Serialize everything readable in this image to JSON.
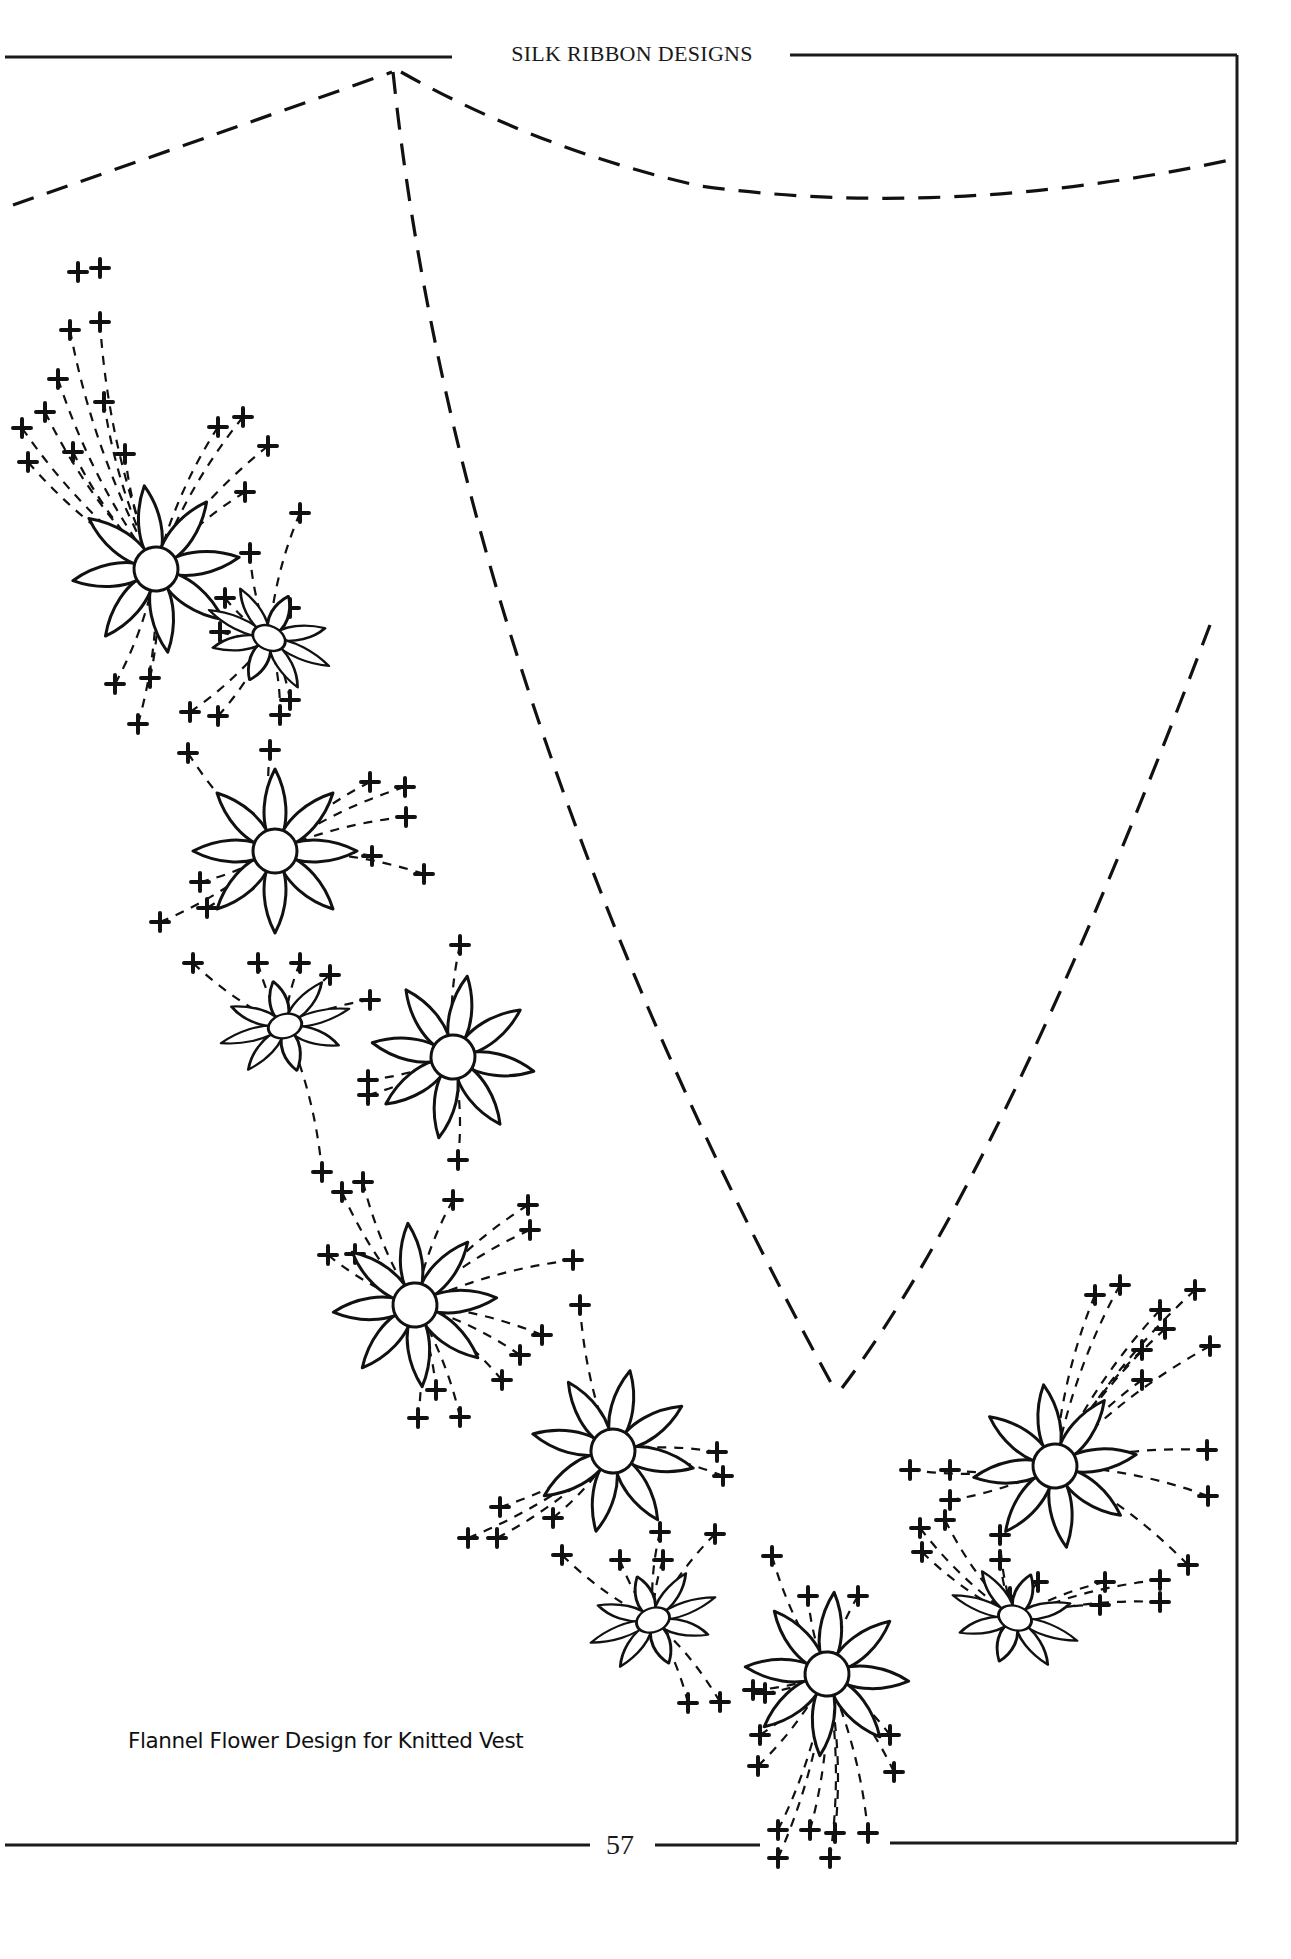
{
  "header": {
    "running_title": "SILK RIBBON DESIGNS"
  },
  "figure": {
    "caption": "Flannel Flower Design for Knitted Vest",
    "stroke_color": "#111111",
    "flowers": [
      {
        "x": 156,
        "y": 569,
        "r": 22,
        "petal": 84,
        "rot": -8,
        "tilt": 1.0
      },
      {
        "x": 269,
        "y": 638,
        "r": 17,
        "petal": 66,
        "rot": 25,
        "tilt": 0.7
      },
      {
        "x": 275,
        "y": 851,
        "r": 22,
        "petal": 82,
        "rot": 0,
        "tilt": 1.0
      },
      {
        "x": 285,
        "y": 1026,
        "r": 17,
        "petal": 66,
        "rot": -15,
        "tilt": 0.7
      },
      {
        "x": 453,
        "y": 1057,
        "r": 22,
        "petal": 82,
        "rot": 10,
        "tilt": 1.0
      },
      {
        "x": 415,
        "y": 1305,
        "r": 22,
        "petal": 82,
        "rot": -5,
        "tilt": 1.0
      },
      {
        "x": 613,
        "y": 1451,
        "r": 22,
        "petal": 82,
        "rot": 12,
        "tilt": 1.0
      },
      {
        "x": 653,
        "y": 1620,
        "r": 17,
        "petal": 66,
        "rot": -20,
        "tilt": 0.7
      },
      {
        "x": 827,
        "y": 1674,
        "r": 22,
        "petal": 82,
        "rot": 5,
        "tilt": 1.0
      },
      {
        "x": 1015,
        "y": 1618,
        "r": 17,
        "petal": 66,
        "rot": 20,
        "tilt": 0.7
      },
      {
        "x": 1055,
        "y": 1466,
        "r": 22,
        "petal": 82,
        "rot": -8,
        "tilt": 1.0
      }
    ],
    "crosses": [
      [
        78,
        272
      ],
      [
        100,
        268
      ],
      [
        70,
        330
      ],
      [
        100,
        322
      ],
      [
        58,
        379
      ],
      [
        104,
        402
      ],
      [
        45,
        412
      ],
      [
        22,
        428
      ],
      [
        28,
        462
      ],
      [
        73,
        452
      ],
      [
        125,
        454
      ],
      [
        218,
        427
      ],
      [
        243,
        417
      ],
      [
        268,
        446
      ],
      [
        245,
        492
      ],
      [
        300,
        513
      ],
      [
        250,
        553
      ],
      [
        225,
        598
      ],
      [
        220,
        632
      ],
      [
        290,
        608
      ],
      [
        115,
        684
      ],
      [
        150,
        678
      ],
      [
        138,
        724
      ],
      [
        190,
        712
      ],
      [
        218,
        716
      ],
      [
        188,
        753
      ],
      [
        280,
        715
      ],
      [
        290,
        700
      ],
      [
        270,
        750
      ],
      [
        370,
        782
      ],
      [
        405,
        787
      ],
      [
        406,
        817
      ],
      [
        372,
        856
      ],
      [
        424,
        874
      ],
      [
        200,
        882
      ],
      [
        160,
        922
      ],
      [
        207,
        908
      ],
      [
        193,
        963
      ],
      [
        258,
        963
      ],
      [
        300,
        963
      ],
      [
        460,
        945
      ],
      [
        330,
        975
      ],
      [
        370,
        1000
      ],
      [
        368,
        1080
      ],
      [
        368,
        1095
      ],
      [
        322,
        1172
      ],
      [
        342,
        1192
      ],
      [
        363,
        1182
      ],
      [
        328,
        1255
      ],
      [
        355,
        1254
      ],
      [
        458,
        1160
      ],
      [
        453,
        1200
      ],
      [
        528,
        1205
      ],
      [
        530,
        1230
      ],
      [
        573,
        1260
      ],
      [
        580,
        1305
      ],
      [
        542,
        1335
      ],
      [
        520,
        1355
      ],
      [
        436,
        1390
      ],
      [
        418,
        1418
      ],
      [
        460,
        1417
      ],
      [
        502,
        1380
      ],
      [
        500,
        1507
      ],
      [
        497,
        1538
      ],
      [
        468,
        1538
      ],
      [
        553,
        1518
      ],
      [
        562,
        1555
      ],
      [
        660,
        1532
      ],
      [
        717,
        1452
      ],
      [
        723,
        1476
      ],
      [
        620,
        1560
      ],
      [
        663,
        1560
      ],
      [
        715,
        1534
      ],
      [
        772,
        1556
      ],
      [
        808,
        1596
      ],
      [
        858,
        1596
      ],
      [
        753,
        1690
      ],
      [
        765,
        1693
      ],
      [
        688,
        1703
      ],
      [
        720,
        1702
      ],
      [
        760,
        1735
      ],
      [
        890,
        1735
      ],
      [
        758,
        1766
      ],
      [
        894,
        1772
      ],
      [
        778,
        1830
      ],
      [
        810,
        1830
      ],
      [
        835,
        1833
      ],
      [
        868,
        1833
      ],
      [
        778,
        1858
      ],
      [
        830,
        1858
      ],
      [
        910,
        1470
      ],
      [
        950,
        1470
      ],
      [
        950,
        1500
      ],
      [
        920,
        1528
      ],
      [
        945,
        1520
      ],
      [
        922,
        1552
      ],
      [
        1000,
        1535
      ],
      [
        1000,
        1560
      ],
      [
        1010,
        1597
      ],
      [
        1038,
        1582
      ],
      [
        1105,
        1582
      ],
      [
        1100,
        1605
      ],
      [
        1160,
        1580
      ],
      [
        1160,
        1602
      ],
      [
        1188,
        1565
      ],
      [
        1207,
        1450
      ],
      [
        1208,
        1496
      ],
      [
        1195,
        1290
      ],
      [
        1120,
        1285
      ],
      [
        1095,
        1295
      ],
      [
        1160,
        1310
      ],
      [
        1165,
        1329
      ],
      [
        1210,
        1346
      ],
      [
        1142,
        1350
      ],
      [
        1142,
        1380
      ]
    ]
  },
  "footer": {
    "page_number": "57"
  }
}
